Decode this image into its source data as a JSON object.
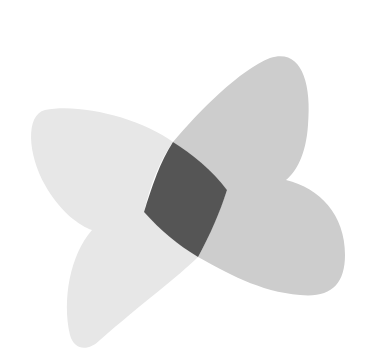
{
  "diagram": {
    "type": "venn-like overlapping petals",
    "background": "#ffffff",
    "shapes": [
      {
        "name": "shape-a",
        "description": "light gray petal pair (upper-left + lower-left lobes)",
        "color": "#e7e7e7"
      },
      {
        "name": "shape-b",
        "description": "medium gray petal pair (upper-right + lower-right lobes)",
        "color": "#cdcdcd"
      },
      {
        "name": "intersection",
        "description": "dark gray overlap region",
        "color": "#555555"
      }
    ]
  }
}
